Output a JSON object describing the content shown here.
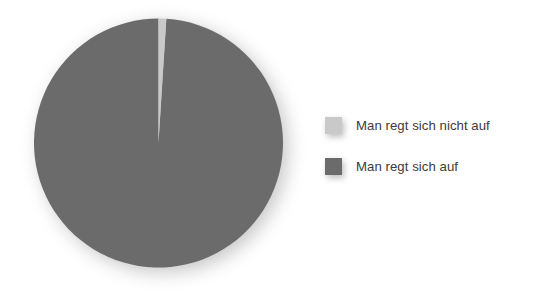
{
  "chart_data": {
    "type": "pie",
    "title": "",
    "subtitle": "",
    "xlabel": "",
    "ylabel": "",
    "grid": false,
    "legend_position": "right",
    "start_angle_deg": 0,
    "direction": "clockwise",
    "categories": [
      "Man regt sich nicht auf",
      "Man regt sich auf"
    ],
    "values": [
      1,
      99
    ],
    "value_unit": "%",
    "slices": [
      {
        "label": "Man regt sich nicht auf",
        "value": 1,
        "color": "#c9c9c9",
        "angle_deg": 3.6,
        "data_label_shown": false
      },
      {
        "label": "Man regt sich auf",
        "value": 99,
        "color": "#6b6b6b",
        "angle_deg": 356.4,
        "data_label_shown": false
      }
    ],
    "annotations": []
  },
  "legend": {
    "items": [
      {
        "label": "Man regt sich nicht auf",
        "swatch_color": "#c9c9c9",
        "swatch_icon": "square-swatch-icon"
      },
      {
        "label": "Man regt sich auf",
        "swatch_color": "#6b6b6b",
        "swatch_icon": "square-swatch-icon"
      }
    ]
  },
  "colors": {
    "background": "#ffffff",
    "slice_light": "#c9c9c9",
    "slice_dark": "#6b6b6b",
    "text": "#3b3b3b",
    "shadow": "#9b9b9b"
  },
  "geometry": {
    "pie_center_x": 158,
    "pie_center_y": 143,
    "pie_diameter": 249
  }
}
